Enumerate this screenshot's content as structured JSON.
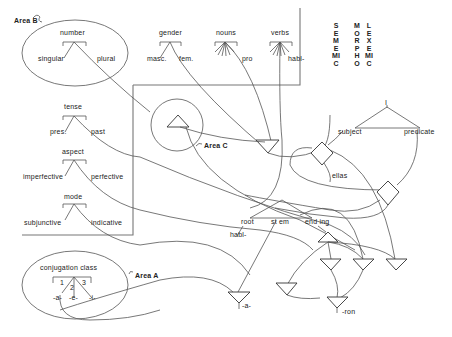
{
  "strata": {
    "sememic": "SEMEMIC",
    "morpho": "MORPHO",
    "lexemic": "LEXEMIC"
  },
  "areas": {
    "a": "Area A",
    "b": "Area B",
    "c": "Area C"
  },
  "categories": {
    "number": {
      "label": "number",
      "options": [
        "singular",
        "plural"
      ]
    },
    "gender": {
      "label": "gender",
      "options": [
        "masc.",
        "fem."
      ]
    },
    "nouns": {
      "label": "nouns",
      "options": [
        "pro"
      ]
    },
    "verbs": {
      "label": "verbs",
      "options": [
        "habl-"
      ]
    },
    "tense": {
      "label": "tense",
      "options": [
        "pres.",
        "past"
      ]
    },
    "aspect": {
      "label": "aspect",
      "options": [
        "imperfective",
        "perfective"
      ]
    },
    "mode": {
      "label": "mode",
      "options": [
        "subjunctive",
        "indicative"
      ]
    },
    "conjugation": {
      "label": "conjugation class",
      "numbers": [
        "1",
        "2",
        "3"
      ],
      "endings": [
        "-a-",
        "-e-",
        "-i-"
      ]
    }
  },
  "clause": {
    "top": "I",
    "subject": "subject",
    "predicate": "predicate",
    "subject_filler": "ellas"
  },
  "word": {
    "root": "root",
    "stem": "st em",
    "ending": "end ing",
    "root_filler": "habl-"
  },
  "morphs": {
    "theme_vowel": "-a-",
    "suffix": "-ron"
  }
}
